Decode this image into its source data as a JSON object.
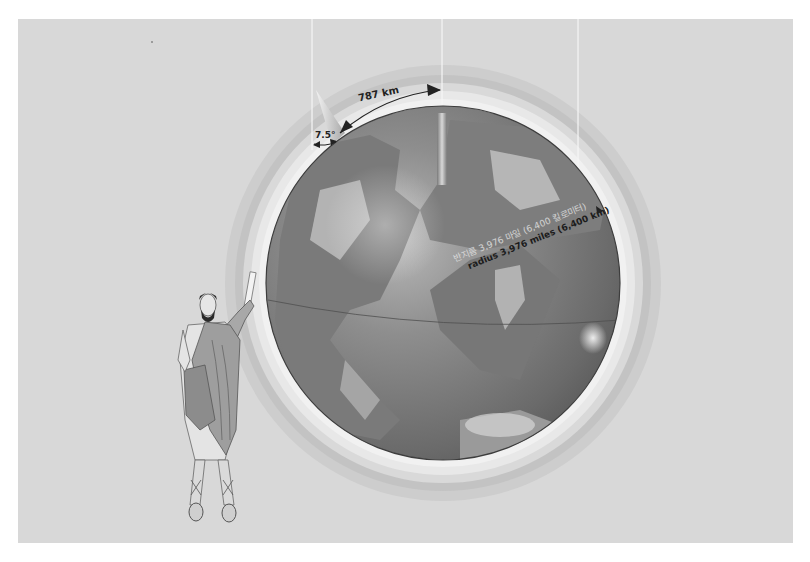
{
  "figure": {
    "background_color": "#d8d8d8",
    "globe": {
      "center": [
        443,
        283
      ],
      "radius": 177,
      "ocean_color": "#6f6f6f",
      "land_color": "#8a8a8a",
      "halo_colors": [
        "#e9e9e9",
        "#cfcfcf",
        "#b9b9b9",
        "#c8c8c8"
      ]
    },
    "annotations": {
      "arc_distance": "787 km",
      "angle": "7.5°",
      "radius_korean": "반지름 3,976 마일 (6,400 킬로미터)",
      "radius_english": "radius 3,976 miles (6,400 km)"
    },
    "figure_person": "Greek scholar in robes holding a scroll",
    "sun_rays_x": [
      312,
      442,
      578
    ]
  }
}
